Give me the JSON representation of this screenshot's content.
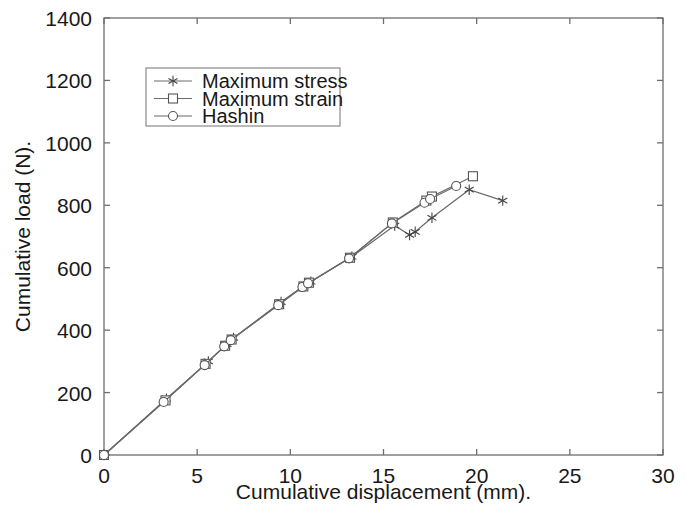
{
  "chart_data": {
    "type": "line",
    "title": "",
    "xlabel": "Cumulative displacement   (mm).",
    "ylabel": "Cumulative load (N).",
    "xlim": [
      0,
      30
    ],
    "ylim": [
      0,
      1400
    ],
    "xticks": [
      0,
      5,
      10,
      15,
      20,
      25,
      30
    ],
    "yticks": [
      0,
      200,
      400,
      600,
      800,
      1000,
      1200,
      1400
    ],
    "xtick_labels": [
      "0",
      "5",
      "10",
      "15",
      "20",
      "25",
      "30"
    ],
    "ytick_labels": [
      "0",
      "200",
      "400",
      "600",
      "800",
      "1000",
      "1200",
      "1400"
    ],
    "grid": false,
    "legend_position": "upper-left-inside",
    "series": [
      {
        "name": "Maximum stress",
        "marker": "star",
        "color": "#6a6a6a",
        "points": [
          [
            0.0,
            0
          ],
          [
            3.35,
            180
          ],
          [
            5.6,
            300
          ],
          [
            6.6,
            355
          ],
          [
            6.95,
            375
          ],
          [
            9.5,
            490
          ],
          [
            10.8,
            545
          ],
          [
            11.1,
            555
          ],
          [
            13.3,
            635
          ],
          [
            15.6,
            735
          ],
          [
            16.4,
            705
          ],
          [
            16.7,
            715
          ],
          [
            17.6,
            760
          ],
          [
            19.6,
            850
          ],
          [
            21.4,
            815
          ]
        ]
      },
      {
        "name": "Maximum strain",
        "marker": "square",
        "color": "#6a6a6a",
        "points": [
          [
            0.0,
            0
          ],
          [
            3.3,
            175
          ],
          [
            5.45,
            292
          ],
          [
            6.5,
            350
          ],
          [
            6.85,
            370
          ],
          [
            9.4,
            483
          ],
          [
            10.7,
            540
          ],
          [
            11.0,
            552
          ],
          [
            13.2,
            632
          ],
          [
            15.5,
            745
          ],
          [
            17.3,
            815
          ],
          [
            17.6,
            828
          ],
          [
            19.8,
            893
          ]
        ]
      },
      {
        "name": "Hashin",
        "marker": "circle",
        "color": "#6a6a6a",
        "points": [
          [
            0.0,
            0
          ],
          [
            3.2,
            170
          ],
          [
            5.4,
            288
          ],
          [
            6.45,
            348
          ],
          [
            6.8,
            368
          ],
          [
            9.35,
            480
          ],
          [
            10.65,
            538
          ],
          [
            10.95,
            550
          ],
          [
            13.15,
            630
          ],
          [
            15.45,
            742
          ],
          [
            17.2,
            808
          ],
          [
            17.5,
            820
          ],
          [
            18.9,
            862
          ]
        ]
      }
    ]
  },
  "legend": {
    "entries": [
      {
        "label": "Maximum stress",
        "marker": "star-icon"
      },
      {
        "label": "Maximum strain",
        "marker": "square-icon"
      },
      {
        "label": "Hashin",
        "marker": "circle-icon"
      }
    ]
  }
}
